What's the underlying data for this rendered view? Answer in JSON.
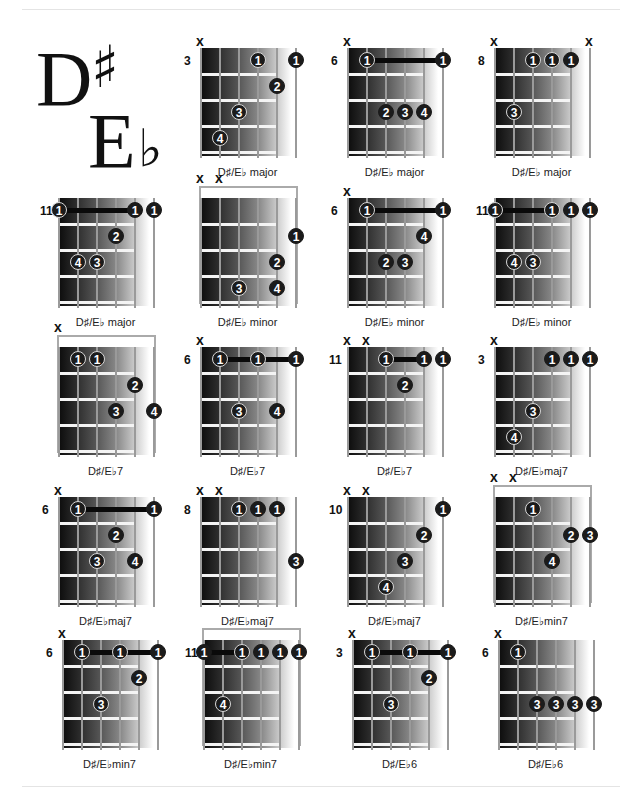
{
  "title": {
    "note": "D",
    "sharp": "♯",
    "alt_note": "E",
    "flat": "♭"
  },
  "chords": [
    {
      "label": "D♯/E♭ major",
      "x": 200,
      "y": 48,
      "fret": "3",
      "nut": false,
      "mutes": [
        0
      ],
      "dots": [
        {
          "s": 3,
          "f": 1,
          "n": "1"
        },
        {
          "s": 5,
          "f": 1,
          "n": "1",
          "solid": true
        },
        {
          "s": 4,
          "f": 2,
          "n": "2",
          "solid": true
        },
        {
          "s": 2,
          "f": 3,
          "n": "3"
        },
        {
          "s": 1,
          "f": 4,
          "n": "4"
        }
      ],
      "barre": null
    },
    {
      "label": "D♯/E♭ major",
      "x": 347,
      "y": 48,
      "fret": "6",
      "nut": false,
      "mutes": [
        0
      ],
      "dots": [
        {
          "s": 1,
          "f": 1,
          "n": "1"
        },
        {
          "s": 5,
          "f": 1,
          "n": "1",
          "solid": true
        },
        {
          "s": 2,
          "f": 3,
          "n": "2",
          "solid": true
        },
        {
          "s": 3,
          "f": 3,
          "n": "3",
          "solid": true
        },
        {
          "s": 4,
          "f": 3,
          "n": "4",
          "solid": true
        }
      ],
      "barre": {
        "from": 1,
        "to": 5,
        "f": 1
      }
    },
    {
      "label": "D♯/E♭ major",
      "x": 494,
      "y": 48,
      "fret": "8",
      "nut": false,
      "mutes": [
        0,
        5
      ],
      "dots": [
        {
          "s": 2,
          "f": 1,
          "n": "1"
        },
        {
          "s": 3,
          "f": 1,
          "n": "1"
        },
        {
          "s": 4,
          "f": 1,
          "n": "1",
          "solid": true
        },
        {
          "s": 1,
          "f": 3,
          "n": "3"
        }
      ],
      "barre": null
    },
    {
      "label": "D♯/E♭ major",
      "x": 58,
      "y": 198,
      "fret": "11",
      "nut": false,
      "mutes": [],
      "dots": [
        {
          "s": 0,
          "f": 1,
          "n": "1"
        },
        {
          "s": 4,
          "f": 1,
          "n": "1",
          "solid": true
        },
        {
          "s": 5,
          "f": 1,
          "n": "1",
          "solid": true
        },
        {
          "s": 3,
          "f": 2,
          "n": "2",
          "solid": true
        },
        {
          "s": 1,
          "f": 3,
          "n": "4"
        },
        {
          "s": 2,
          "f": 3,
          "n": "3"
        }
      ],
      "barre": {
        "from": 0,
        "to": 4,
        "f": 1
      }
    },
    {
      "label": "D♯/E♭ minor",
      "x": 200,
      "y": 198,
      "fret": "",
      "nut": true,
      "mutes": [
        0,
        1
      ],
      "dots": [
        {
          "s": 5,
          "f": 2,
          "n": "1",
          "solid": true
        },
        {
          "s": 4,
          "f": 3,
          "n": "2",
          "solid": true
        },
        {
          "s": 2,
          "f": 4,
          "n": "3"
        },
        {
          "s": 4,
          "f": 4,
          "n": "4",
          "solid": true
        }
      ],
      "barre": null
    },
    {
      "label": "D♯/E♭ minor",
      "x": 347,
      "y": 198,
      "fret": "6",
      "nut": false,
      "mutes": [
        0
      ],
      "dots": [
        {
          "s": 1,
          "f": 1,
          "n": "1"
        },
        {
          "s": 5,
          "f": 1,
          "n": "1",
          "solid": true
        },
        {
          "s": 4,
          "f": 2,
          "n": "4",
          "solid": true
        },
        {
          "s": 2,
          "f": 3,
          "n": "2",
          "solid": true
        },
        {
          "s": 3,
          "f": 3,
          "n": "3",
          "solid": true
        }
      ],
      "barre": {
        "from": 1,
        "to": 5,
        "f": 1
      }
    },
    {
      "label": "D♯/E♭ minor",
      "x": 494,
      "y": 198,
      "fret": "11",
      "nut": false,
      "mutes": [],
      "dots": [
        {
          "s": 0,
          "f": 1,
          "n": "1"
        },
        {
          "s": 3,
          "f": 1,
          "n": "1"
        },
        {
          "s": 4,
          "f": 1,
          "n": "1",
          "solid": true
        },
        {
          "s": 5,
          "f": 1,
          "n": "1",
          "solid": true
        },
        {
          "s": 1,
          "f": 3,
          "n": "4"
        },
        {
          "s": 2,
          "f": 3,
          "n": "3"
        }
      ],
      "barre": {
        "from": 0,
        "to": 3,
        "f": 1
      }
    },
    {
      "label": "D♯/E♭7",
      "x": 58,
      "y": 347,
      "fret": "",
      "nut": true,
      "mutes": [
        0
      ],
      "dots": [
        {
          "s": 1,
          "f": 1,
          "n": "1"
        },
        {
          "s": 2,
          "f": 1,
          "n": "1"
        },
        {
          "s": 4,
          "f": 2,
          "n": "2",
          "solid": true
        },
        {
          "s": 3,
          "f": 3,
          "n": "3",
          "solid": true
        },
        {
          "s": 5,
          "f": 3,
          "n": "4",
          "solid": true
        }
      ],
      "barre": null
    },
    {
      "label": "D♯/E♭7",
      "x": 200,
      "y": 347,
      "fret": "6",
      "nut": false,
      "mutes": [
        0
      ],
      "dots": [
        {
          "s": 1,
          "f": 1,
          "n": "1"
        },
        {
          "s": 3,
          "f": 1,
          "n": "1"
        },
        {
          "s": 5,
          "f": 1,
          "n": "1",
          "solid": true
        },
        {
          "s": 2,
          "f": 3,
          "n": "3"
        },
        {
          "s": 4,
          "f": 3,
          "n": "4",
          "solid": true
        }
      ],
      "barre": {
        "from": 1,
        "to": 5,
        "f": 1
      }
    },
    {
      "label": "D♯/E♭7",
      "x": 347,
      "y": 347,
      "fret": "11",
      "nut": false,
      "mutes": [
        0,
        1
      ],
      "dots": [
        {
          "s": 2,
          "f": 1,
          "n": "1"
        },
        {
          "s": 4,
          "f": 1,
          "n": "1",
          "solid": true
        },
        {
          "s": 5,
          "f": 1,
          "n": "1",
          "solid": true
        },
        {
          "s": 3,
          "f": 2,
          "n": "2",
          "solid": true
        }
      ],
      "barre": {
        "from": 2,
        "to": 4,
        "f": 1
      }
    },
    {
      "label": "D♯/E♭maj7",
      "x": 494,
      "y": 347,
      "fret": "3",
      "nut": false,
      "mutes": [
        0
      ],
      "dots": [
        {
          "s": 3,
          "f": 1,
          "n": "1",
          "solid": true
        },
        {
          "s": 4,
          "f": 1,
          "n": "1",
          "solid": true
        },
        {
          "s": 5,
          "f": 1,
          "n": "1",
          "solid": true
        },
        {
          "s": 2,
          "f": 3,
          "n": "3"
        },
        {
          "s": 1,
          "f": 4,
          "n": "4"
        }
      ],
      "barre": null
    },
    {
      "label": "D♯/E♭maj7",
      "x": 58,
      "y": 497,
      "fret": "6",
      "nut": false,
      "mutes": [
        0
      ],
      "dots": [
        {
          "s": 1,
          "f": 1,
          "n": "1"
        },
        {
          "s": 5,
          "f": 1,
          "n": "1",
          "solid": true
        },
        {
          "s": 3,
          "f": 2,
          "n": "2",
          "solid": true
        },
        {
          "s": 2,
          "f": 3,
          "n": "3"
        },
        {
          "s": 4,
          "f": 3,
          "n": "4",
          "solid": true
        }
      ],
      "barre": {
        "from": 1,
        "to": 5,
        "f": 1
      }
    },
    {
      "label": "D♯/E♭maj7",
      "x": 200,
      "y": 497,
      "fret": "8",
      "nut": false,
      "mutes": [
        0,
        1
      ],
      "dots": [
        {
          "s": 2,
          "f": 1,
          "n": "1"
        },
        {
          "s": 3,
          "f": 1,
          "n": "1",
          "solid": true
        },
        {
          "s": 4,
          "f": 1,
          "n": "1",
          "solid": true
        },
        {
          "s": 5,
          "f": 3,
          "n": "3",
          "solid": true
        }
      ],
      "barre": null
    },
    {
      "label": "D♯/E♭maj7",
      "x": 347,
      "y": 497,
      "fret": "10",
      "nut": false,
      "mutes": [
        0,
        1
      ],
      "dots": [
        {
          "s": 5,
          "f": 1,
          "n": "1",
          "solid": true
        },
        {
          "s": 4,
          "f": 2,
          "n": "2",
          "solid": true
        },
        {
          "s": 3,
          "f": 3,
          "n": "3",
          "solid": true
        },
        {
          "s": 2,
          "f": 4,
          "n": "4"
        }
      ],
      "barre": null
    },
    {
      "label": "D♯/E♭min7",
      "x": 494,
      "y": 497,
      "fret": "",
      "nut": true,
      "mutes": [
        0,
        1
      ],
      "dots": [
        {
          "s": 2,
          "f": 1,
          "n": "1"
        },
        {
          "s": 4,
          "f": 2,
          "n": "2",
          "solid": true
        },
        {
          "s": 5,
          "f": 2,
          "n": "3",
          "solid": true
        },
        {
          "s": 3,
          "f": 3,
          "n": "4",
          "solid": true
        }
      ],
      "barre": null
    },
    {
      "label": "D♯/E♭min7",
      "x": 62,
      "y": 640,
      "fret": "6",
      "nut": false,
      "mutes": [
        0
      ],
      "dots": [
        {
          "s": 1,
          "f": 1,
          "n": "1"
        },
        {
          "s": 3,
          "f": 1,
          "n": "1"
        },
        {
          "s": 5,
          "f": 1,
          "n": "1",
          "solid": true
        },
        {
          "s": 4,
          "f": 2,
          "n": "2",
          "solid": true
        },
        {
          "s": 2,
          "f": 3,
          "n": "3"
        }
      ],
      "barre": {
        "from": 1,
        "to": 5,
        "f": 1
      }
    },
    {
      "label": "D♯/E♭min7",
      "x": 203,
      "y": 640,
      "fret": "11",
      "nut": true,
      "mutes": [],
      "dots": [
        {
          "s": 0,
          "f": 1,
          "n": "1",
          "solid": true
        },
        {
          "s": 2,
          "f": 1,
          "n": "1"
        },
        {
          "s": 3,
          "f": 1,
          "n": "1",
          "solid": true
        },
        {
          "s": 4,
          "f": 1,
          "n": "1",
          "solid": true
        },
        {
          "s": 5,
          "f": 1,
          "n": "1",
          "solid": true
        },
        {
          "s": 1,
          "f": 3,
          "n": "4"
        }
      ],
      "barre": {
        "from": 0,
        "to": 2,
        "f": 1
      }
    },
    {
      "label": "D♯/E♭6",
      "x": 352,
      "y": 640,
      "fret": "3",
      "nut": false,
      "mutes": [
        0
      ],
      "dots": [
        {
          "s": 1,
          "f": 1,
          "n": "1"
        },
        {
          "s": 3,
          "f": 1,
          "n": "1"
        },
        {
          "s": 5,
          "f": 1,
          "n": "1",
          "solid": true
        },
        {
          "s": 4,
          "f": 2,
          "n": "2",
          "solid": true
        },
        {
          "s": 2,
          "f": 3,
          "n": "3"
        }
      ],
      "barre": {
        "from": 1,
        "to": 5,
        "f": 1
      }
    },
    {
      "label": "D♯/E♭6",
      "x": 498,
      "y": 640,
      "fret": "6",
      "nut": false,
      "mutes": [
        0
      ],
      "dots": [
        {
          "s": 1,
          "f": 1,
          "n": "1"
        },
        {
          "s": 2,
          "f": 3,
          "n": "3",
          "solid": true
        },
        {
          "s": 3,
          "f": 3,
          "n": "3",
          "solid": true
        },
        {
          "s": 4,
          "f": 3,
          "n": "3",
          "solid": true
        },
        {
          "s": 5,
          "f": 3,
          "n": "3",
          "solid": true
        }
      ],
      "barre": null
    }
  ],
  "mute_symbol": "x"
}
